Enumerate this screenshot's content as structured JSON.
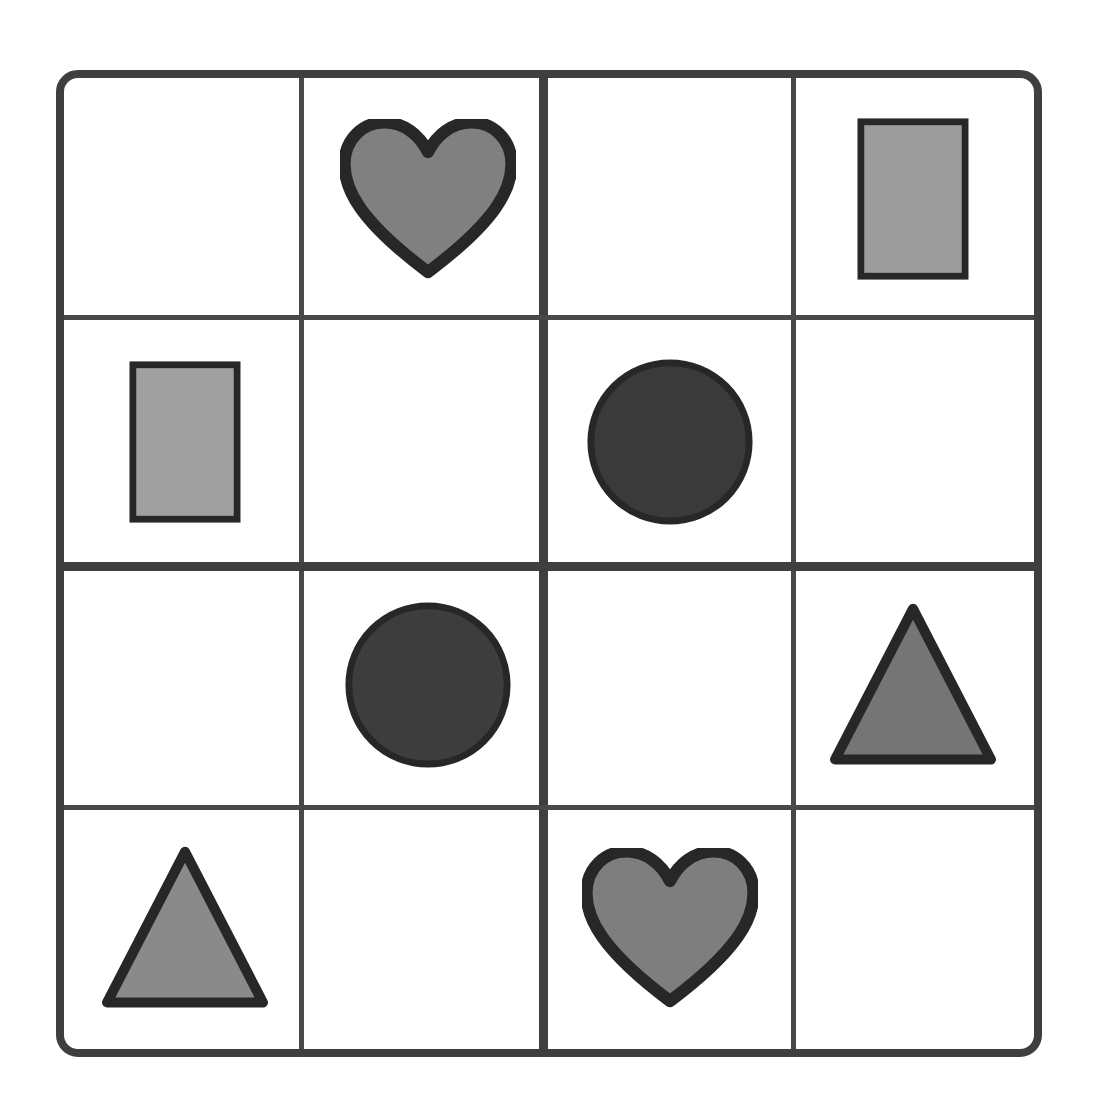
{
  "puzzle": {
    "title": "Shape Grid Puzzle",
    "grid": {
      "rows": 4,
      "columns": 4
    },
    "colors": {
      "background": "#ffffff",
      "border": "#3f3f3f",
      "gridline": "#494949",
      "shape_outline": "#272727",
      "gray_medium": "#808080",
      "gray_light": "#9c9c9c",
      "gray_dark": "#3a3a3a",
      "gray_triangle_right": "#757575",
      "gray_triangle_left": "#8a8a8a"
    },
    "cells": [
      {
        "row": 1,
        "col": 1,
        "shape": "empty",
        "label": "empty",
        "fill": ""
      },
      {
        "row": 1,
        "col": 2,
        "shape": "heart",
        "label": "gray heart",
        "fill": "#808080"
      },
      {
        "row": 1,
        "col": 3,
        "shape": "empty",
        "label": "empty",
        "fill": ""
      },
      {
        "row": 1,
        "col": 4,
        "shape": "rectangle",
        "label": "light gray rectangle",
        "fill": "#9c9c9c"
      },
      {
        "row": 2,
        "col": 1,
        "shape": "rectangle",
        "label": "light gray rectangle",
        "fill": "#a0a0a0"
      },
      {
        "row": 2,
        "col": 2,
        "shape": "empty",
        "label": "empty",
        "fill": ""
      },
      {
        "row": 2,
        "col": 3,
        "shape": "circle",
        "label": "dark gray circle",
        "fill": "#3a3a3a"
      },
      {
        "row": 2,
        "col": 4,
        "shape": "empty",
        "label": "empty",
        "fill": ""
      },
      {
        "row": 3,
        "col": 1,
        "shape": "empty",
        "label": "empty",
        "fill": ""
      },
      {
        "row": 3,
        "col": 2,
        "shape": "circle",
        "label": "dark gray circle",
        "fill": "#3d3d3d"
      },
      {
        "row": 3,
        "col": 3,
        "shape": "empty",
        "label": "empty",
        "fill": ""
      },
      {
        "row": 3,
        "col": 4,
        "shape": "triangle",
        "label": "gray triangle",
        "fill": "#757575"
      },
      {
        "row": 4,
        "col": 1,
        "shape": "triangle",
        "label": "gray triangle",
        "fill": "#8a8a8a"
      },
      {
        "row": 4,
        "col": 2,
        "shape": "empty",
        "label": "empty",
        "fill": ""
      },
      {
        "row": 4,
        "col": 3,
        "shape": "heart",
        "label": "gray heart",
        "fill": "#7e7e7e"
      },
      {
        "row": 4,
        "col": 4,
        "shape": "empty",
        "label": "empty",
        "fill": ""
      }
    ]
  }
}
